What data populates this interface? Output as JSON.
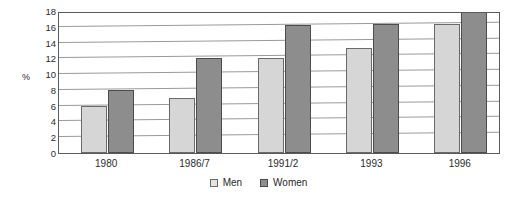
{
  "chart_data": {
    "type": "bar",
    "title": "",
    "subtitle": "",
    "xlabel": "",
    "ylabel": "%",
    "ylim": [
      0,
      18
    ],
    "yticks": [
      0,
      2,
      4,
      6,
      8,
      10,
      12,
      14,
      16,
      18
    ],
    "ytick_labels": [
      "0",
      "2",
      "4",
      "6",
      "8",
      "10",
      "12",
      "14",
      "16",
      "18"
    ],
    "grid": true,
    "grid_axis": "y",
    "legend_position": "bottom-center",
    "categories": [
      "1980",
      "1986/7",
      "1991/2",
      "1993",
      "1996"
    ],
    "series": [
      {
        "name": "Men",
        "color": "#d6d6d6",
        "values": [
          6,
          7,
          12,
          13.3,
          16.4
        ]
      },
      {
        "name": "Women",
        "color": "#8d8d8d",
        "values": [
          8,
          12,
          16.2,
          16.3,
          18
        ]
      }
    ]
  },
  "legend": {
    "entries": [
      {
        "label": "Men"
      },
      {
        "label": "Women"
      }
    ]
  },
  "colors": {
    "men": "#d6d6d6",
    "women": "#8d8d8d",
    "gridline": "#9a9a9a",
    "frame": "#5a5a5a",
    "text": "#2b2b2b"
  }
}
